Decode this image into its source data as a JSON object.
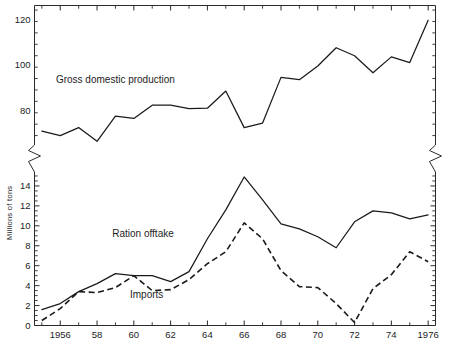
{
  "chart_data": {
    "type": "line",
    "title": "",
    "xlabel": "",
    "ylabel": "Millions of tons",
    "grid": false,
    "legend_position": "inline-annotations",
    "axis_break": true,
    "x": [
      1955,
      1956,
      1957,
      1958,
      1959,
      1960,
      1961,
      1962,
      1963,
      1964,
      1965,
      1966,
      1967,
      1968,
      1969,
      1970,
      1971,
      1972,
      1973,
      1974,
      1975,
      1976
    ],
    "xlim": [
      1954.6,
      1976.4
    ],
    "xticks_major": [
      1956,
      1958,
      1960,
      1962,
      1964,
      1966,
      1968,
      1970,
      1972,
      1974,
      1976
    ],
    "xtick_labels": [
      "1956",
      "58",
      "60",
      "62",
      "64",
      "66",
      "68",
      "70",
      "72",
      "74",
      "1976"
    ],
    "upper_panel": {
      "ylim": [
        64,
        126
      ],
      "yticks_major": [
        60,
        80,
        100,
        120
      ],
      "ytick_labels": [
        "120",
        "100",
        "80",
        "60"
      ],
      "ytick_minor_step": 5
    },
    "lower_panel": {
      "ylim": [
        0,
        15.6
      ],
      "yticks_major": [
        0,
        2,
        4,
        6,
        8,
        10,
        12,
        14
      ],
      "ytick_labels": [
        "14",
        "12",
        "10",
        "8",
        "6",
        "4",
        "2",
        "0"
      ],
      "ytick_minor_step": 0.5
    },
    "series": [
      {
        "name": "Gross domestic production",
        "panel": "upper",
        "style": "solid",
        "label_x": 1959.0,
        "label_y": 92.0,
        "values": [
          71.0,
          69.0,
          72.5,
          66.5,
          77.5,
          76.5,
          82.3,
          82.3,
          80.8,
          81.0,
          88.5,
          72.5,
          74.5,
          94.5,
          93.5,
          99.5,
          107.5,
          104.0,
          96.5,
          103.5,
          101.0,
          119.5
        ]
      },
      {
        "name": "Ration offtake",
        "panel": "lower",
        "style": "solid",
        "label_x": 1960.5,
        "label_y": 8.9,
        "values": [
          1.6,
          2.2,
          3.4,
          4.2,
          5.2,
          5.0,
          5.0,
          4.4,
          5.4,
          8.7,
          11.6,
          14.9,
          12.6,
          10.2,
          9.7,
          8.9,
          7.8,
          10.4,
          11.5,
          11.3,
          10.7,
          11.1
        ]
      },
      {
        "name": "Imports",
        "panel": "lower",
        "style": "dashed",
        "label_x": 1960.7,
        "label_y": 2.8,
        "values": [
          0.5,
          1.7,
          3.4,
          3.3,
          3.8,
          5.0,
          3.5,
          3.6,
          4.6,
          6.2,
          7.4,
          10.3,
          8.7,
          5.5,
          3.9,
          3.8,
          2.2,
          0.3,
          3.7,
          5.1,
          7.4,
          6.4
        ]
      }
    ]
  },
  "annotations": {
    "gross_domestic_production": "Gross domestic production",
    "ration_offtake": "Ration offtake",
    "imports": "Imports"
  },
  "axis": {
    "y_title": "Millions of tons"
  }
}
